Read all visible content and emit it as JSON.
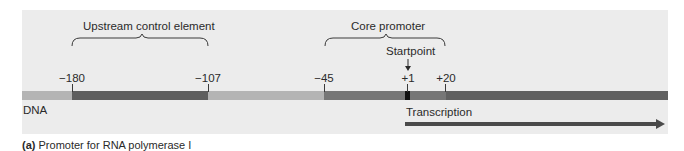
{
  "figure": {
    "caption_prefix": "(a)",
    "caption_text": " Promoter for RNA polymerase I",
    "dna_label": "DNA",
    "regions": [
      {
        "name": "upstream-control-element",
        "label": "Upstream control element",
        "from": "-180",
        "to": "-107"
      },
      {
        "name": "core-promoter",
        "label": "Core promoter",
        "from": "-45",
        "to": "+20"
      }
    ],
    "positions": [
      "-180",
      "-107",
      "-45",
      "+1",
      "+20"
    ],
    "position_labels": {
      "p180": "−180",
      "p107": "−107",
      "p45": "−45",
      "p1": "+1",
      "p20": "+20"
    },
    "startpoint_label": "Startpoint",
    "transcription_label": "Transcription",
    "colors": {
      "panel_bg": "#ececec",
      "dna_light": "#b4b4b4",
      "dna_dark": "#5e5e5e",
      "dna_medium": "#6e6e6e",
      "dna_core_start": "#767676",
      "startpoint_block": "#111111",
      "arrow": "#4a4a4a"
    }
  }
}
